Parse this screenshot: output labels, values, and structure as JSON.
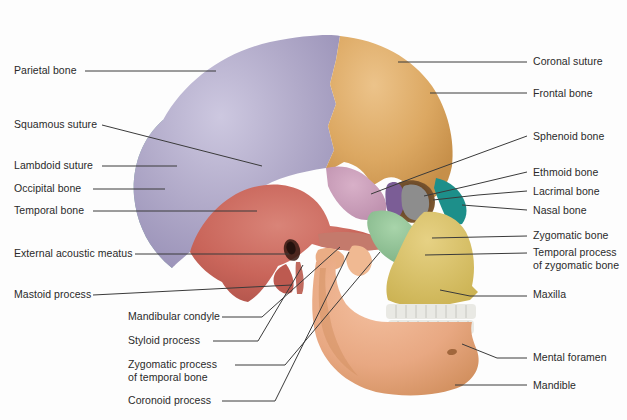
{
  "figure": {
    "background_color": "#fdfdfd",
    "label_text_color": "#2a2a2a",
    "leader_line_color": "#3a3a3a"
  },
  "palette": {
    "parietal_bone": "#a9a2c4",
    "frontal_bone": "#dca862",
    "occipital_bone": "#7aa8a2",
    "temporal_bone": "#c9655a",
    "sphenoid_bone": "#c89ab6",
    "ethmoid_bone": "#1d8f8a",
    "lacrimal_bone": "#7b5d96",
    "nasal_bone": "#8d8d8d",
    "zygomatic_bone": "#8cc090",
    "maxilla": "#d9c060",
    "mandible": "#e8a882",
    "teeth": "#e9e9e4",
    "orbit_shadow": "#6d4b2c"
  },
  "labels": [
    {
      "id": "parietal-bone",
      "text": "Parietal bone",
      "side": "left",
      "x": 14,
      "y": 64
    },
    {
      "id": "squamous-suture",
      "text": "Squamous suture",
      "side": "left",
      "x": 14,
      "y": 118
    },
    {
      "id": "lambdoid-suture",
      "text": "Lambdoid suture",
      "side": "left",
      "x": 14,
      "y": 159
    },
    {
      "id": "occipital-bone",
      "text": "Occipital bone",
      "side": "left",
      "x": 14,
      "y": 182
    },
    {
      "id": "temporal-bone",
      "text": "Temporal bone",
      "side": "left",
      "x": 14,
      "y": 204
    },
    {
      "id": "external-acoustic-meatus",
      "text": "External acoustic meatus",
      "side": "left",
      "x": 14,
      "y": 247
    },
    {
      "id": "mastoid-process",
      "text": "Mastoid process",
      "side": "left",
      "x": 14,
      "y": 288
    },
    {
      "id": "mandibular-condyle",
      "text": "Mandibular condyle",
      "side": "left",
      "x": 128,
      "y": 310
    },
    {
      "id": "styloid-process",
      "text": "Styloid process",
      "side": "left",
      "x": 128,
      "y": 334
    },
    {
      "id": "zygomatic-process",
      "text": "Zygomatic process\nof temporal bone",
      "side": "left",
      "x": 128,
      "y": 358
    },
    {
      "id": "coronoid-process",
      "text": "Coronoid process",
      "side": "left",
      "x": 128,
      "y": 394
    },
    {
      "id": "coronal-suture",
      "text": "Coronal suture",
      "side": "right",
      "x": 533,
      "y": 55
    },
    {
      "id": "frontal-bone",
      "text": "Frontal bone",
      "side": "right",
      "x": 533,
      "y": 87
    },
    {
      "id": "sphenoid-bone",
      "text": "Sphenoid bone",
      "side": "right",
      "x": 533,
      "y": 130
    },
    {
      "id": "ethmoid-bone",
      "text": "Ethmoid bone",
      "side": "right",
      "x": 533,
      "y": 166
    },
    {
      "id": "lacrimal-bone",
      "text": "Lacrimal bone",
      "side": "right",
      "x": 533,
      "y": 185
    },
    {
      "id": "nasal-bone",
      "text": "Nasal bone",
      "side": "right",
      "x": 533,
      "y": 204
    },
    {
      "id": "zygomatic-bone",
      "text": "Zygomatic bone",
      "side": "right",
      "x": 533,
      "y": 229
    },
    {
      "id": "temporal-process",
      "text": "Temporal process\nof zygomatic bone",
      "side": "right",
      "x": 533,
      "y": 246
    },
    {
      "id": "maxilla",
      "text": "Maxilla",
      "side": "right",
      "x": 533,
      "y": 288
    },
    {
      "id": "mental-foramen",
      "text": "Mental foramen",
      "side": "right",
      "x": 533,
      "y": 351
    },
    {
      "id": "mandible",
      "text": "Mandible",
      "side": "right",
      "x": 533,
      "y": 379
    }
  ],
  "leaders": [
    {
      "id": "leader-parietal-bone",
      "points": "85,71 216,71"
    },
    {
      "id": "leader-squamous-suture",
      "points": "102,125 262,166"
    },
    {
      "id": "leader-lambdoid-suture",
      "points": "102,166 177,166"
    },
    {
      "id": "leader-occipital-bone",
      "points": "93,189 165,189"
    },
    {
      "id": "leader-temporal-bone",
      "points": "93,211 257,211"
    },
    {
      "id": "leader-external-acoustic-meatus",
      "points": "135,254 289,254"
    },
    {
      "id": "leader-mastoid-process",
      "points": "93,295 292,285"
    },
    {
      "id": "leader-mandibular-condyle",
      "points": "222,317 262,317 340,247"
    },
    {
      "id": "leader-styloid-process",
      "points": "213,341 258,341 303,265"
    },
    {
      "id": "leader-zygomatic-process",
      "points": "235,365 285,365 380,252"
    },
    {
      "id": "leader-coronoid-process",
      "points": "222,401 275,401 349,252"
    },
    {
      "id": "leader-coronal-suture",
      "points": "398,62 527,62"
    },
    {
      "id": "leader-frontal-bone",
      "points": "430,93 527,93"
    },
    {
      "id": "leader-sphenoid-bone",
      "points": "371,194 418,176 527,136"
    },
    {
      "id": "leader-ethmoid-bone",
      "points": "424,196 468,186 527,172"
    },
    {
      "id": "leader-lacrimal-bone",
      "points": "433,200 478,195 527,191"
    },
    {
      "id": "leader-nasal-bone",
      "points": "462,205 527,210"
    },
    {
      "id": "leader-zygomatic-bone",
      "points": "432,238 527,236"
    },
    {
      "id": "leader-temporal-process",
      "points": "425,255 527,253"
    },
    {
      "id": "leader-maxilla",
      "points": "440,290 470,296 527,296"
    },
    {
      "id": "leader-mental-foramen",
      "points": "462,344 497,358 527,358"
    },
    {
      "id": "leader-mandible",
      "points": "455,385 527,385"
    }
  ]
}
